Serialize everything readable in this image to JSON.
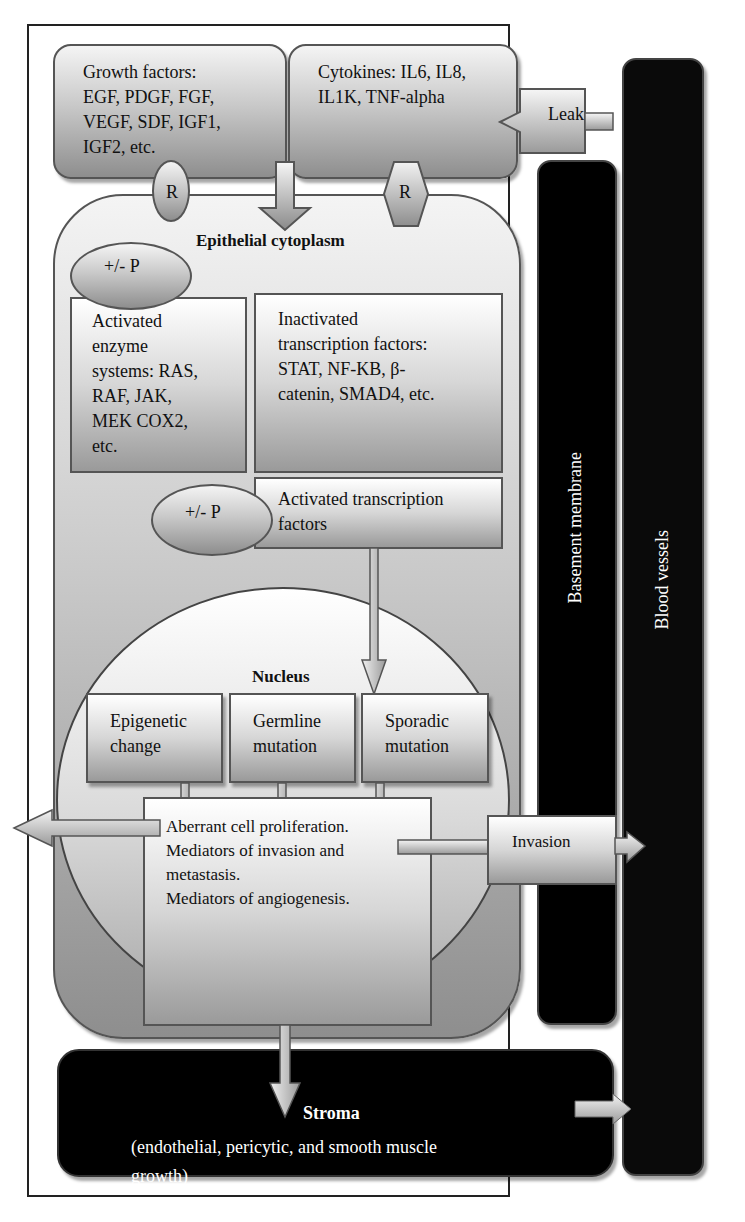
{
  "diagram": {
    "extracellular": {
      "growth_factors": {
        "label": "Growth factors:",
        "items": "EGF, PDGF, FGF, VEGF, SDF, IGF1, IGF2, etc.",
        "lines": [
          "Growth factors:",
          "EGF, PDGF, FGF,",
          "VEGF, SDF, IGF1,",
          "IGF2, etc."
        ]
      },
      "cytokines": {
        "lines": [
          "Cytokines: IL6, IL8,",
          "IL1K, TNF-alpha"
        ]
      },
      "leak": {
        "label": "Leak"
      },
      "receptor_left": {
        "label": "R",
        "shape": "ellipse"
      },
      "receptor_right": {
        "label": "R",
        "shape": "hexagon"
      }
    },
    "cytoplasm": {
      "title": "Epithelial cytoplasm",
      "phospho_top": {
        "label": "+/- P"
      },
      "activated_enzymes": {
        "lines": [
          "Activated",
          "enzyme",
          "systems: RAS,",
          "RAF, JAK,",
          "MEK COX2,",
          "etc."
        ]
      },
      "inactivated_tf": {
        "lines": [
          "Inactivated",
          "transcription factors:",
          "STAT, NF-KB, β-",
          "catenin, SMAD4, etc."
        ]
      },
      "phospho_mid": {
        "label": "+/- P"
      },
      "activated_tf": {
        "lines": [
          "Activated transcription",
          "factors"
        ]
      }
    },
    "nucleus": {
      "title": "Nucleus",
      "boxes": [
        {
          "lines": [
            "Epigenetic",
            "change"
          ]
        },
        {
          "lines": [
            "Germline",
            "mutation"
          ]
        },
        {
          "lines": [
            "Sporadic",
            "mutation"
          ]
        }
      ],
      "outcome": {
        "lines": [
          "Aberrant cell proliferation.",
          "Mediators of invasion and",
          "metastasis.",
          "Mediators of angiogenesis."
        ]
      }
    },
    "invasion": {
      "label": "Invasion"
    },
    "basement_membrane": {
      "label": "Basement membrane"
    },
    "blood_vessels": {
      "label": "Blood vessels"
    },
    "stroma": {
      "title": "Stroma",
      "lines": [
        "(endothelial, pericytic, and smooth muscle",
        "growth)"
      ]
    },
    "colors": {
      "dark_region": "#000000",
      "gray_gradient_top": "#f4f4f4",
      "gray_gradient_bottom": "#8e8e8e",
      "border": "#555555"
    }
  }
}
